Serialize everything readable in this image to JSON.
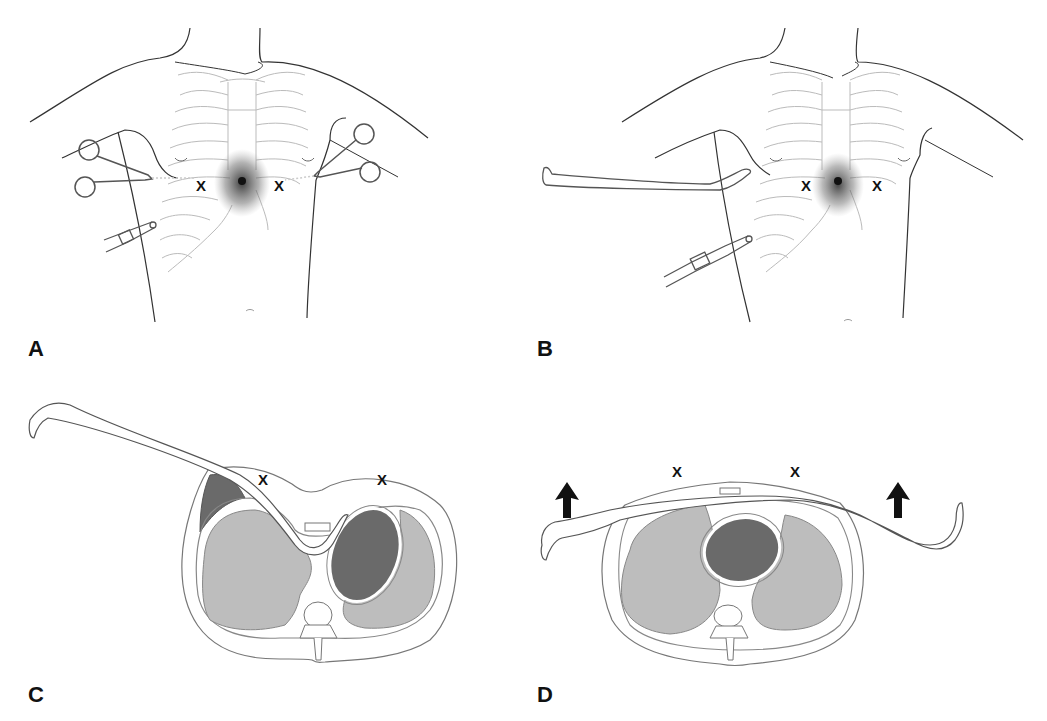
{
  "figure": {
    "panels": [
      {
        "id": "A",
        "label": "A",
        "view": "anterior chest",
        "markers": [
          "X",
          "X"
        ],
        "instruments": [
          "hemostat-left",
          "hemostat-right",
          "chest-tube"
        ]
      },
      {
        "id": "B",
        "label": "B",
        "view": "anterior chest",
        "markers": [
          "X",
          "X"
        ],
        "instruments": [
          "curved-retractor",
          "chest-tube"
        ]
      },
      {
        "id": "C",
        "label": "C",
        "view": "axial cross-section",
        "markers": [
          "X",
          "X"
        ],
        "instruments": [
          "curved-retractor"
        ]
      },
      {
        "id": "D",
        "label": "D",
        "view": "axial cross-section",
        "markers": [
          "X",
          "X"
        ],
        "instruments": [
          "curved-retractor"
        ],
        "arrows": [
          "up",
          "up"
        ]
      }
    ],
    "colors": {
      "outline": "#333333",
      "rib": "#b8b8b8",
      "lung": "#bdbdbd",
      "heart": "#6a6a6a",
      "shading": "#555555",
      "background": "#ffffff"
    }
  }
}
